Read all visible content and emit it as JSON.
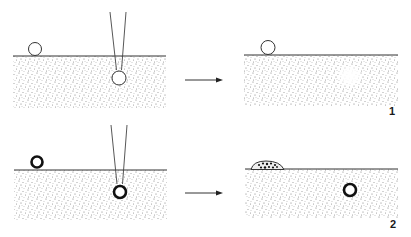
{
  "diagram": {
    "colors": {
      "ink": "#333333",
      "stipple": "#8a8a8a",
      "background": "#ffffff"
    },
    "panels": [
      {
        "id": "1",
        "label": "1",
        "before": {
          "surface_object": "small hollow sphere (thin outline)",
          "injected_object": "hollow sphere (thin outline) at pipette tip"
        },
        "after": {
          "surface_object": "small hollow sphere remains on surface",
          "injected_result": "diffuse cleared region in substrate"
        }
      },
      {
        "id": "2",
        "label": "2",
        "before": {
          "surface_object": "thick-walled ring",
          "injected_object": "thick-walled ring at pipette tip"
        },
        "after": {
          "surface_object": "dome-shaped colony with dark granules on surface",
          "injected_result": "thick-walled ring remains embedded"
        }
      }
    ],
    "arrow_symbol": "right-arrow"
  }
}
